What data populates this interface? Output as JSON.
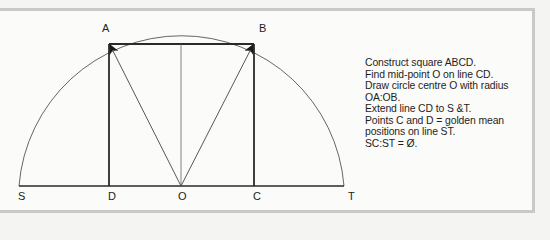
{
  "diagram": {
    "colors": {
      "background": "#fbfbf9",
      "frame": "#c9c9c6",
      "line": "#2a2a2a",
      "thin_line": "#555555"
    },
    "points": {
      "A": {
        "label": "A",
        "x": 109,
        "y": 44
      },
      "B": {
        "label": "B",
        "x": 254,
        "y": 44
      },
      "C": {
        "label": "C",
        "x": 254,
        "y": 186
      },
      "D": {
        "label": "D",
        "x": 109,
        "y": 186
      },
      "O": {
        "label": "O",
        "x": 181,
        "y": 186
      },
      "S": {
        "label": "S",
        "x": 19,
        "y": 186
      },
      "T": {
        "label": "T",
        "x": 344,
        "y": 186
      }
    },
    "labels": {
      "A": "A",
      "B": "B",
      "C": "C",
      "D": "D",
      "O": "O",
      "S": "S",
      "T": "T"
    },
    "circle": {
      "center": "O",
      "radius": 163
    },
    "instructions": [
      "Construct square ABCD.",
      "Find mid-point O on line CD.",
      "Draw circle centre O with radius",
      "OA:OB.",
      "Extend line CD to S &T.",
      "Points C and D = golden mean",
      "positions on line ST.",
      "SC:ST =  Ø."
    ]
  }
}
